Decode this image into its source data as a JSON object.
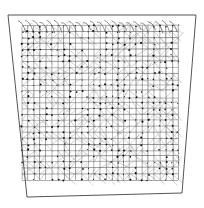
{
  "artwork": {
    "subject": "hand-drawn dense grid pattern inside trapezoidal frame",
    "frame": {
      "corners": [
        [
          8,
          15
        ],
        [
          196,
          15
        ],
        [
          182,
          193
        ],
        [
          27,
          197
        ]
      ],
      "stroke": "#555555"
    },
    "grid": {
      "x_start": 22,
      "x_end": 178,
      "y_start": 26,
      "y_end": 180,
      "columns": 26,
      "rows": 26,
      "line_color": "#2a2a2a",
      "diagonal_color": "#6a6a6a"
    },
    "top_strokes": {
      "count": 22,
      "color": "#444444"
    }
  }
}
